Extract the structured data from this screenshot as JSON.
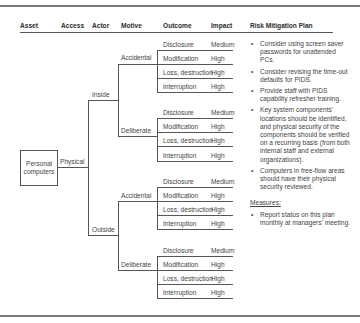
{
  "headers": {
    "asset": "Asset",
    "access": "Access",
    "actor": "Actor",
    "motive": "Motive",
    "outcome": "Outcome",
    "impact": "Impact",
    "plan": "Risk Mitigation Plan"
  },
  "asset": "Personal computers",
  "access": "Physical",
  "actors": [
    {
      "label": "Inside",
      "motives": [
        {
          "label": "Accidental",
          "outcomes": [
            {
              "outcome": "Disclosure",
              "impact": "Medium"
            },
            {
              "outcome": "Modification",
              "impact": "High"
            },
            {
              "outcome": "Loss, destruction",
              "impact": "High"
            },
            {
              "outcome": "Interruption",
              "impact": "High"
            }
          ]
        },
        {
          "label": "Deliberate",
          "outcomes": [
            {
              "outcome": "Disclosure",
              "impact": "Medium"
            },
            {
              "outcome": "Modification",
              "impact": "High"
            },
            {
              "outcome": "Loss, destruction",
              "impact": "High"
            },
            {
              "outcome": "Interruption",
              "impact": "High"
            }
          ]
        }
      ]
    },
    {
      "label": "Outside",
      "motives": [
        {
          "label": "Accidental",
          "outcomes": [
            {
              "outcome": "Disclosure",
              "impact": "Medium"
            },
            {
              "outcome": "Modification",
              "impact": "High"
            },
            {
              "outcome": "Loss, destruction",
              "impact": "High"
            },
            {
              "outcome": "Interruption",
              "impact": "High"
            }
          ]
        },
        {
          "label": "Deliberate",
          "outcomes": [
            {
              "outcome": "Disclosure",
              "impact": "Medium"
            },
            {
              "outcome": "Modification",
              "impact": "High"
            },
            {
              "outcome": "Loss, destruction",
              "impact": "High"
            },
            {
              "outcome": "Interruption",
              "impact": "High"
            }
          ]
        }
      ]
    }
  ],
  "plan": {
    "items": [
      "Consider using screen saver passwords for unattended PCs.",
      "Consider revising the time-out defaults for PIDS.",
      "Provide staff with PIDS capability refresher training.",
      "Key system components' locations should be identified, and physical security of the components should be verified on a recurring basis (from both internal staff and external organizations).",
      "Computers in free-flow areas should have their physical security reviewed."
    ],
    "measures_label": "Measures:",
    "measures": [
      "Report status on this plan monthly at managers' meeting."
    ]
  }
}
